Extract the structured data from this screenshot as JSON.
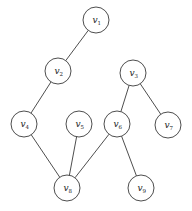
{
  "diagram": {
    "type": "graph",
    "directed": false,
    "node_radius": 13,
    "colors": {
      "stroke": "#3a3a3a",
      "fill": "#ffffff",
      "text": "#222222"
    },
    "nodes": [
      {
        "id": "v1",
        "label": "v",
        "sub": "1",
        "x": 96,
        "y": 20
      },
      {
        "id": "v2",
        "label": "v",
        "sub": "2",
        "x": 58,
        "y": 71
      },
      {
        "id": "v3",
        "label": "v",
        "sub": "3",
        "x": 133,
        "y": 73
      },
      {
        "id": "v4",
        "label": "v",
        "sub": "4",
        "x": 24,
        "y": 124
      },
      {
        "id": "v5",
        "label": "v",
        "sub": "5",
        "x": 79,
        "y": 124
      },
      {
        "id": "v6",
        "label": "v",
        "sub": "6",
        "x": 117,
        "y": 124
      },
      {
        "id": "v7",
        "label": "v",
        "sub": "7",
        "x": 168,
        "y": 125
      },
      {
        "id": "v8",
        "label": "v",
        "sub": "8",
        "x": 67,
        "y": 188
      },
      {
        "id": "v9",
        "label": "v",
        "sub": "9",
        "x": 141,
        "y": 188
      }
    ],
    "edges": [
      {
        "from": "v1",
        "to": "v2"
      },
      {
        "from": "v2",
        "to": "v4"
      },
      {
        "from": "v3",
        "to": "v6"
      },
      {
        "from": "v3",
        "to": "v7"
      },
      {
        "from": "v4",
        "to": "v8"
      },
      {
        "from": "v5",
        "to": "v8"
      },
      {
        "from": "v6",
        "to": "v8"
      },
      {
        "from": "v6",
        "to": "v9"
      }
    ]
  }
}
